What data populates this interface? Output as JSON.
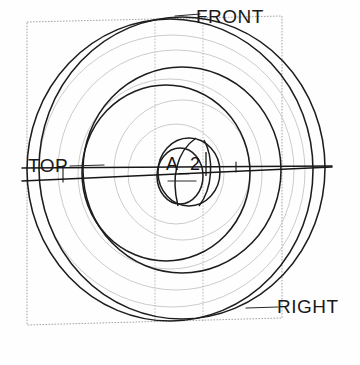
{
  "drawing": {
    "title": "Wireframe circular part isometric view",
    "background_color": "#fefefe",
    "line_color": "#1a1a1a",
    "faint_line_color": "#b9b9b9",
    "box_line_color": "#8c8c8c"
  },
  "labels": {
    "front": "FRONT",
    "top": "TOP",
    "right": "RIGHT",
    "axis": "A_2"
  },
  "geometry": {
    "center": {
      "x": 178,
      "y": 172
    },
    "bounding_box": {
      "top_left": {
        "x": 27,
        "y": 22
      },
      "top_right": {
        "x": 282,
        "y": 16
      },
      "bottom_right": {
        "x": 282,
        "y": 318
      },
      "bottom_left": {
        "x": 27,
        "y": 325
      }
    },
    "vertical_construction_lines": [
      155,
      203
    ],
    "circles": [
      {
        "name": "outer-rim-front",
        "cx": 170,
        "cy": 170,
        "r": 148,
        "tone": "dark"
      },
      {
        "name": "outer-rim-back",
        "cx": 180,
        "cy": 168,
        "r": 148,
        "tone": "dark"
      },
      {
        "name": "mid-disc-outer",
        "cx": 180,
        "cy": 170,
        "r": 101,
        "tone": "dark"
      },
      {
        "name": "mid-disc-inner",
        "cx": 166,
        "cy": 172,
        "r": 85,
        "tone": "dark"
      },
      {
        "name": "faint-ring-a",
        "cx": 176,
        "cy": 170,
        "r": 118,
        "tone": "faint"
      },
      {
        "name": "faint-ring-b",
        "cx": 170,
        "cy": 174,
        "r": 92,
        "tone": "faint"
      },
      {
        "name": "faint-ring-c",
        "cx": 182,
        "cy": 170,
        "r": 68,
        "tone": "faint"
      },
      {
        "name": "faint-ring-d",
        "cx": 176,
        "cy": 174,
        "r": 48,
        "tone": "faint"
      },
      {
        "name": "hub-outer",
        "cx": 188,
        "cy": 172,
        "r": 33,
        "tone": "dark"
      },
      {
        "name": "hub-bore",
        "cx": 180,
        "cy": 175,
        "r": 24,
        "tone": "dark"
      }
    ],
    "axis_lines": [
      {
        "name": "axis-upper",
        "x1": 20,
        "y1": 168,
        "x2": 332,
        "y2": 166
      },
      {
        "name": "axis-lower",
        "x1": 20,
        "y1": 180,
        "x2": 332,
        "y2": 167
      }
    ]
  }
}
